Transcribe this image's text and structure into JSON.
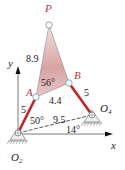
{
  "diagram": {
    "type": "four-bar linkage with coupler point",
    "points": {
      "P": {
        "label": "P"
      },
      "A": {
        "label": "A"
      },
      "B": {
        "label": "B"
      },
      "O2": {
        "label": "O",
        "sub": "2"
      },
      "O4": {
        "label": "O",
        "sub": "4"
      }
    },
    "axes": {
      "x": "x",
      "y": "y"
    },
    "dimensions": {
      "AP": "8.9",
      "AB": "4.4",
      "O2A": "5",
      "O4B": "5",
      "O2O4": "9.5"
    },
    "angles": {
      "PAB": "56°",
      "crank": "50°",
      "ground": "14°"
    },
    "colors": {
      "link": "#c0262d",
      "coupler_fill": "#d9a3a3",
      "label": "#b23a48",
      "line": "#333333"
    }
  }
}
